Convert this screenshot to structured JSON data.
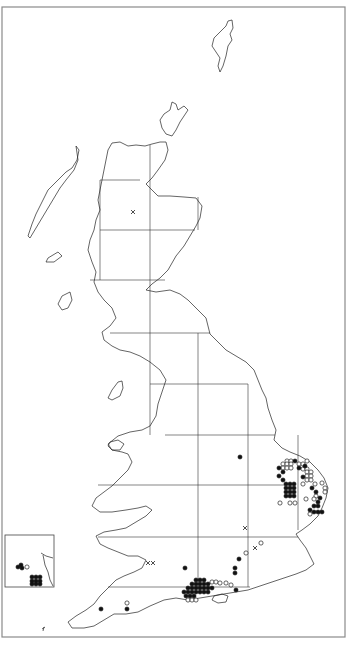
{
  "map": {
    "type": "distribution-map",
    "region": "Great Britain",
    "frame": {
      "x": 2,
      "y": 7,
      "w": 343,
      "h": 630
    },
    "grid": {
      "vertical_lines_x": [
        100,
        150,
        198,
        248,
        298
      ],
      "horizontal_lines_y": [
        180,
        230,
        280,
        333,
        384,
        435,
        485,
        537,
        587
      ]
    },
    "legend_symbols": {
      "filled_circle": "recent record",
      "open_circle": "older record",
      "cross": "introduced / doubtful record"
    },
    "colors": {
      "ink": "#111111",
      "background": "#ffffff",
      "frame": "#8a8a8a"
    },
    "inset": {
      "label": "Channel Islands inset",
      "box": {
        "x": 5,
        "y": 535,
        "w": 49,
        "h": 52
      },
      "filled": [
        [
          21,
          565
        ],
        [
          18,
          567
        ],
        [
          22,
          568
        ],
        [
          32,
          577
        ],
        [
          36,
          577
        ],
        [
          40,
          577
        ],
        [
          32,
          581
        ],
        [
          36,
          581
        ],
        [
          40,
          581
        ],
        [
          32,
          584
        ],
        [
          36,
          584
        ],
        [
          40,
          584
        ]
      ],
      "open": [
        [
          27,
          567
        ]
      ]
    },
    "records": {
      "filled": [
        [
          240,
          457
        ],
        [
          279,
          468
        ],
        [
          283,
          472
        ],
        [
          279,
          476
        ],
        [
          283,
          480
        ],
        [
          299,
          468
        ],
        [
          303,
          477
        ],
        [
          312,
          488
        ],
        [
          316,
          492
        ],
        [
          286,
          484
        ],
        [
          290,
          484
        ],
        [
          294,
          484
        ],
        [
          286,
          488
        ],
        [
          290,
          488
        ],
        [
          294,
          488
        ],
        [
          286,
          492
        ],
        [
          290,
          492
        ],
        [
          294,
          492
        ],
        [
          286,
          496
        ],
        [
          290,
          496
        ],
        [
          294,
          496
        ],
        [
          314,
          506
        ],
        [
          318,
          506
        ],
        [
          318,
          502
        ],
        [
          320,
          498
        ],
        [
          310,
          510
        ],
        [
          314,
          512
        ],
        [
          318,
          512
        ],
        [
          322,
          512
        ],
        [
          295,
          461
        ],
        [
          305,
          466
        ],
        [
          239,
          559
        ],
        [
          235,
          568
        ],
        [
          235,
          573
        ],
        [
          185,
          568
        ],
        [
          196,
          580
        ],
        [
          200,
          580
        ],
        [
          204,
          580
        ],
        [
          192,
          584
        ],
        [
          196,
          584
        ],
        [
          200,
          584
        ],
        [
          204,
          584
        ],
        [
          208,
          584
        ],
        [
          188,
          588
        ],
        [
          192,
          588
        ],
        [
          196,
          588
        ],
        [
          200,
          588
        ],
        [
          204,
          588
        ],
        [
          208,
          588
        ],
        [
          212,
          588
        ],
        [
          184,
          592
        ],
        [
          188,
          592
        ],
        [
          192,
          592
        ],
        [
          196,
          592
        ],
        [
          200,
          592
        ],
        [
          204,
          592
        ],
        [
          208,
          592
        ],
        [
          186,
          596
        ],
        [
          190,
          596
        ],
        [
          194,
          596
        ],
        [
          236,
          590
        ],
        [
          101,
          609
        ],
        [
          127,
          609
        ]
      ],
      "open": [
        [
          287,
          461
        ],
        [
          291,
          461
        ],
        [
          283,
          464
        ],
        [
          287,
          464
        ],
        [
          291,
          464
        ],
        [
          283,
          468
        ],
        [
          287,
          468
        ],
        [
          291,
          468
        ],
        [
          307,
          461
        ],
        [
          299,
          464
        ],
        [
          303,
          464
        ],
        [
          303,
          469
        ],
        [
          307,
          469
        ],
        [
          307,
          472
        ],
        [
          311,
          472
        ],
        [
          307,
          476
        ],
        [
          311,
          476
        ],
        [
          307,
          480
        ],
        [
          311,
          480
        ],
        [
          303,
          484
        ],
        [
          315,
          484
        ],
        [
          322,
          483
        ],
        [
          325,
          488
        ],
        [
          325,
          492
        ],
        [
          316,
          496
        ],
        [
          306,
          499
        ],
        [
          280,
          503
        ],
        [
          290,
          503
        ],
        [
          295,
          503
        ],
        [
          310,
          514
        ],
        [
          314,
          499
        ],
        [
          261,
          543
        ],
        [
          246,
          553
        ],
        [
          212,
          582
        ],
        [
          216,
          582
        ],
        [
          220,
          583
        ],
        [
          226,
          583
        ],
        [
          231,
          585
        ],
        [
          188,
          600
        ],
        [
          192,
          600
        ],
        [
          196,
          600
        ],
        [
          127,
          603
        ]
      ],
      "cross": [
        [
          133,
          212
        ],
        [
          245,
          528
        ],
        [
          255,
          548
        ],
        [
          148,
          563
        ],
        [
          153,
          563
        ]
      ]
    }
  }
}
